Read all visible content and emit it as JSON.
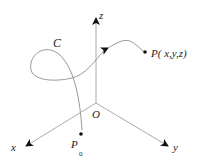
{
  "diagram": {
    "labels": {
      "z_axis": "z",
      "x_axis": "x",
      "y_axis": "y",
      "origin": "O",
      "curve": "C",
      "point": "P( x,y,z)",
      "start_point": "P",
      "start_point_sub": "0"
    },
    "colors": {
      "axis": "#aaaaaa",
      "curve": "#999999",
      "arrow": "#111111",
      "text": "#222222"
    }
  }
}
